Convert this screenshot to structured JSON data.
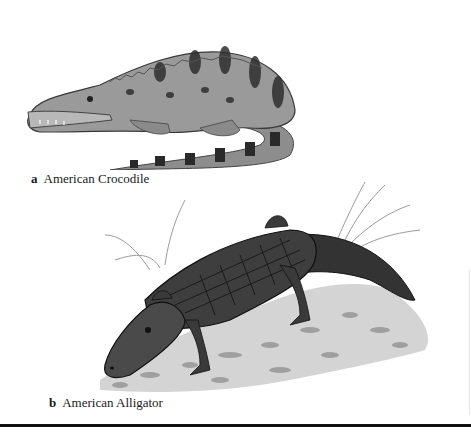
{
  "figure": {
    "panels": [
      {
        "letter": "a",
        "label": "American Crocodile",
        "illustration": "american-crocodile-illustration"
      },
      {
        "letter": "b",
        "label": "American Alligator",
        "illustration": "american-alligator-illustration"
      }
    ],
    "colors": {
      "croc_body": "#9a9a9a",
      "croc_spots": "#2e2e2e",
      "gator_body": "#3a3a3a",
      "ground": "#c8c8c8",
      "rule": "#111111"
    }
  }
}
